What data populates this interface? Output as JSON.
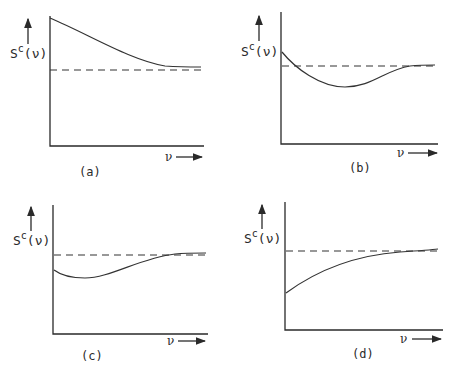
{
  "figure": {
    "panels": [
      {
        "id": "a",
        "caption": "(a)",
        "y_label_main": "S",
        "y_label_sup": "c",
        "y_label_arg": "(ν)",
        "x_label": "ν",
        "description": "S^c(ν) starts high and decays monotonically toward the dashed asymptote from above"
      },
      {
        "id": "b",
        "caption": "(b)",
        "y_label_main": "S",
        "y_label_sup": "c",
        "y_label_arg": "(ν)",
        "x_label": "ν",
        "description": "S^c(ν) starts slightly above asymptote, dips below to a minimum, then recovers to the asymptote"
      },
      {
        "id": "c",
        "caption": "(c)",
        "y_label_main": "S",
        "y_label_sup": "c",
        "y_label_arg": "(ν)",
        "x_label": "ν",
        "description": "S^c(ν) starts below asymptote, dips to a shallow minimum, then rises to the asymptote"
      },
      {
        "id": "d",
        "caption": "(d)",
        "y_label_main": "S",
        "y_label_sup": "c",
        "y_label_arg": "(ν)",
        "x_label": "ν",
        "description": "S^c(ν) starts well below asymptote and rises monotonically toward it"
      }
    ],
    "colors": {
      "ink": "#2a2a2a",
      "background": "#ffffff"
    }
  }
}
